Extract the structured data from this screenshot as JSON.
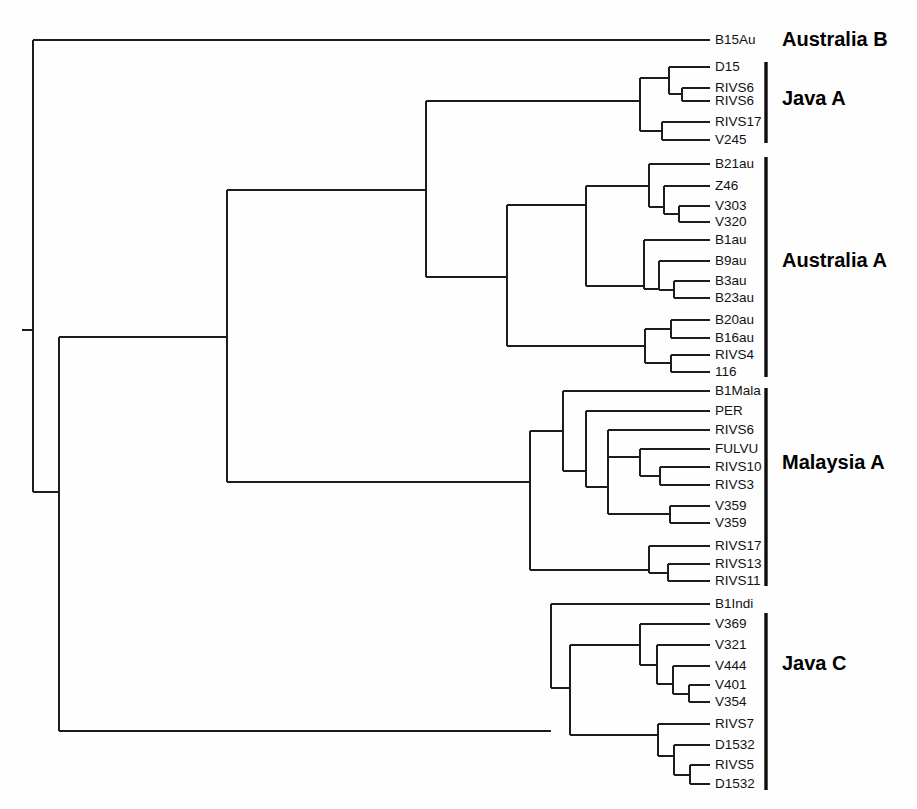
{
  "figure": {
    "name": "phylogenetic-dendrogram",
    "type": "dendrogram",
    "width": 917,
    "height": 809,
    "background_color": "#fefefe",
    "line_color": "#1c1c1c",
    "text_color": "#121212",
    "group_label_color": "#000000"
  },
  "leaves": [
    {
      "id": "L0",
      "label": "B15Au",
      "y": 40,
      "x_tip": 710,
      "group": "Australia B"
    },
    {
      "id": "L1",
      "label": "D15",
      "y": 67,
      "x_tip": 710,
      "group": "Java A"
    },
    {
      "id": "L2",
      "label": "RIVS6",
      "y": 88,
      "x_tip": 710,
      "group": "Java A"
    },
    {
      "id": "L3",
      "label": "RIVS6",
      "y": 101,
      "x_tip": 710,
      "group": "Java A"
    },
    {
      "id": "L4",
      "label": "RIVS17",
      "y": 122,
      "x_tip": 710,
      "group": "Java A"
    },
    {
      "id": "L5",
      "label": "V245",
      "y": 140,
      "x_tip": 710,
      "group": "Java A"
    },
    {
      "id": "L6",
      "label": "B21au",
      "y": 164,
      "x_tip": 710,
      "group": "Australia A"
    },
    {
      "id": "L7",
      "label": "Z46",
      "y": 186,
      "x_tip": 710,
      "group": "Australia A"
    },
    {
      "id": "L8",
      "label": "V303",
      "y": 206,
      "x_tip": 710,
      "group": "Australia A"
    },
    {
      "id": "L9",
      "label": "V320",
      "y": 222,
      "x_tip": 710,
      "group": "Australia A"
    },
    {
      "id": "L10",
      "label": "B1au",
      "y": 240,
      "x_tip": 710,
      "group": "Australia A"
    },
    {
      "id": "L11",
      "label": "B9au",
      "y": 261,
      "x_tip": 710,
      "group": "Australia A"
    },
    {
      "id": "L12",
      "label": "B3au",
      "y": 281,
      "x_tip": 710,
      "group": "Australia A"
    },
    {
      "id": "L13",
      "label": "B23au",
      "y": 298,
      "x_tip": 710,
      "group": "Australia A"
    },
    {
      "id": "L14",
      "label": "B20au",
      "y": 320,
      "x_tip": 710,
      "group": "Australia A"
    },
    {
      "id": "L15",
      "label": "B16au",
      "y": 338,
      "x_tip": 710,
      "group": "Australia A"
    },
    {
      "id": "L16",
      "label": "RIVS4",
      "y": 355,
      "x_tip": 710,
      "group": "Australia A"
    },
    {
      "id": "L17",
      "label": "116",
      "y": 372,
      "x_tip": 710,
      "group": "Australia A"
    },
    {
      "id": "L18",
      "label": "B1Mala",
      "y": 391,
      "x_tip": 710,
      "group": "Malaysia A"
    },
    {
      "id": "L19",
      "label": "PER",
      "y": 411,
      "x_tip": 710,
      "group": "Malaysia A"
    },
    {
      "id": "L20",
      "label": "RIVS6",
      "y": 430,
      "x_tip": 710,
      "group": "Malaysia A"
    },
    {
      "id": "L21",
      "label": "FULVU",
      "y": 449,
      "x_tip": 710,
      "group": "Malaysia A"
    },
    {
      "id": "L22",
      "label": "RIVS10",
      "y": 467,
      "x_tip": 710,
      "group": "Malaysia A"
    },
    {
      "id": "L23",
      "label": "RIVS3",
      "y": 485,
      "x_tip": 710,
      "group": "Malaysia A"
    },
    {
      "id": "L24",
      "label": "V359",
      "y": 506,
      "x_tip": 710,
      "group": "Malaysia A"
    },
    {
      "id": "L25",
      "label": "V359",
      "y": 523,
      "x_tip": 710,
      "group": "Malaysia A"
    },
    {
      "id": "L26",
      "label": "RIVS17",
      "y": 546,
      "x_tip": 710,
      "group": "Malaysia A"
    },
    {
      "id": "L27",
      "label": "RIVS13",
      "y": 564,
      "x_tip": 710,
      "group": "Malaysia A"
    },
    {
      "id": "L28",
      "label": "RIVS11",
      "y": 581,
      "x_tip": 710,
      "group": "Malaysia A"
    },
    {
      "id": "L29",
      "label": "B1Indi",
      "y": 604,
      "x_tip": 710,
      "group": "Java C"
    },
    {
      "id": "L30",
      "label": "V369",
      "y": 624,
      "x_tip": 710,
      "group": "Java C"
    },
    {
      "id": "L31",
      "label": "V321",
      "y": 645,
      "x_tip": 710,
      "group": "Java C"
    },
    {
      "id": "L32",
      "label": "V444",
      "y": 666,
      "x_tip": 710,
      "group": "Java C"
    },
    {
      "id": "L33",
      "label": "V401",
      "y": 685,
      "x_tip": 710,
      "group": "Java C"
    },
    {
      "id": "L34",
      "label": "V354",
      "y": 702,
      "x_tip": 710,
      "group": "Java C"
    },
    {
      "id": "L35",
      "label": "RIVS7",
      "y": 724,
      "x_tip": 710,
      "group": "Java C"
    },
    {
      "id": "L36",
      "label": "D1532",
      "y": 745,
      "x_tip": 710,
      "group": "Java C"
    },
    {
      "id": "L37",
      "label": "RIVS5",
      "y": 765,
      "x_tip": 710,
      "group": "Java C"
    },
    {
      "id": "L38",
      "label": "D1532",
      "y": 784,
      "x_tip": 710,
      "group": "Java C"
    }
  ],
  "internal_nodes": [
    {
      "id": "N_root",
      "x": 33,
      "y_top": 40,
      "y_bottom": 492,
      "x_parent": 22,
      "y": 330
    },
    {
      "id": "N_main",
      "x": 59,
      "y_top": 337,
      "y_bottom": 731,
      "x_parent": 33,
      "y": 492
    },
    {
      "id": "N_aus_java",
      "x": 227,
      "y_top": 190,
      "y_bottom": 482,
      "x_parent": 59,
      "y": 337
    },
    {
      "id": "N_javaA_ausA",
      "x": 426,
      "y_top": 101,
      "y_bottom": 277,
      "x_parent": 227,
      "y": 190
    },
    {
      "id": "N_javaA",
      "x": 640,
      "y_top": 78,
      "y_bottom": 131,
      "x_parent": 426,
      "y": 101
    },
    {
      "id": "N_javaA_a",
      "x": 669,
      "y_top": 67,
      "y_bottom": 94,
      "x_parent": 640,
      "y": 78
    },
    {
      "id": "N_javaA_b",
      "x": 682,
      "y_top": 88,
      "y_bottom": 101,
      "x_parent": 669,
      "y": 94
    },
    {
      "id": "N_javaA_c",
      "x": 662,
      "y_top": 122,
      "y_bottom": 140,
      "x_parent": 640,
      "y": 131
    },
    {
      "id": "N_ausA",
      "x": 507,
      "y_top": 205,
      "y_bottom": 346,
      "x_parent": 426,
      "y": 277
    },
    {
      "id": "N_ausA_up",
      "x": 586,
      "y_top": 186,
      "y_bottom": 286,
      "x_parent": 507,
      "y": 205
    },
    {
      "id": "N_ausA_a",
      "x": 649,
      "y_top": 164,
      "y_bottom": 207,
      "x_parent": 586,
      "y": 186
    },
    {
      "id": "N_ausA_b",
      "x": 664,
      "y_top": 186,
      "y_bottom": 214,
      "x_parent": 649,
      "y": 207
    },
    {
      "id": "N_ausA_c",
      "x": 679,
      "y_top": 206,
      "y_bottom": 222,
      "x_parent": 664,
      "y": 214
    },
    {
      "id": "N_ausA_d",
      "x": 644,
      "y_top": 240,
      "y_bottom": 289,
      "x_parent": 586,
      "y": 286
    },
    {
      "id": "N_ausA_e",
      "x": 659,
      "y_top": 261,
      "y_bottom": 290,
      "x_parent": 644,
      "y": 289
    },
    {
      "id": "N_ausA_f",
      "x": 674,
      "y_top": 281,
      "y_bottom": 298,
      "x_parent": 659,
      "y": 290
    },
    {
      "id": "N_ausA_g",
      "x": 645,
      "y_top": 329,
      "y_bottom": 363,
      "x_parent": 507,
      "y": 346
    },
    {
      "id": "N_ausA_h",
      "x": 671,
      "y_top": 320,
      "y_bottom": 338,
      "x_parent": 645,
      "y": 329
    },
    {
      "id": "N_ausA_i",
      "x": 671,
      "y_top": 355,
      "y_bottom": 372,
      "x_parent": 645,
      "y": 363
    },
    {
      "id": "N_mal",
      "x": 530,
      "y_top": 431,
      "y_bottom": 570,
      "x_parent": 227,
      "y": 482
    },
    {
      "id": "N_mal_up",
      "x": 563,
      "y_top": 391,
      "y_bottom": 471,
      "x_parent": 530,
      "y": 431
    },
    {
      "id": "N_mal_a",
      "x": 586,
      "y_top": 411,
      "y_bottom": 487,
      "x_parent": 563,
      "y": 471
    },
    {
      "id": "N_mal_b",
      "x": 608,
      "y_top": 430,
      "y_bottom": 514,
      "x_parent": 586,
      "y": 487
    },
    {
      "id": "N_mal_c",
      "x": 640,
      "y_top": 449,
      "y_bottom": 476,
      "x_parent": 608,
      "y": 457
    },
    {
      "id": "N_mal_d",
      "x": 660,
      "y_top": 467,
      "y_bottom": 485,
      "x_parent": 640,
      "y": 476
    },
    {
      "id": "N_mal_e",
      "x": 670,
      "y_top": 506,
      "y_bottom": 523,
      "x_parent": 608,
      "y": 514
    },
    {
      "id": "N_mal_f",
      "x": 649,
      "y_top": 546,
      "y_bottom": 573,
      "x_parent": 530,
      "y": 570
    },
    {
      "id": "N_mal_g",
      "x": 668,
      "y_top": 564,
      "y_bottom": 581,
      "x_parent": 649,
      "y": 573
    },
    {
      "id": "N_javaC",
      "x": 551,
      "y_top": 604,
      "y_bottom": 688,
      "x_parent": 59,
      "y": 731
    },
    {
      "id": "N_javaC_in",
      "x": 570,
      "y_top": 645,
      "y_bottom": 735,
      "x_parent": 551,
      "y": 688
    },
    {
      "id": "N_javaC_a",
      "x": 640,
      "y_top": 624,
      "y_bottom": 665,
      "x_parent": 570,
      "y": 645
    },
    {
      "id": "N_javaC_b",
      "x": 657,
      "y_top": 645,
      "y_bottom": 684,
      "x_parent": 640,
      "y": 665
    },
    {
      "id": "N_javaC_c",
      "x": 673,
      "y_top": 666,
      "y_bottom": 694,
      "x_parent": 657,
      "y": 684
    },
    {
      "id": "N_javaC_d",
      "x": 689,
      "y_top": 685,
      "y_bottom": 702,
      "x_parent": 673,
      "y": 694
    },
    {
      "id": "N_javaC_e",
      "x": 658,
      "y_top": 724,
      "y_bottom": 756,
      "x_parent": 570,
      "y": 735
    },
    {
      "id": "N_javaC_f",
      "x": 674,
      "y_top": 745,
      "y_bottom": 775,
      "x_parent": 658,
      "y": 756
    },
    {
      "id": "N_javaC_g",
      "x": 690,
      "y_top": 765,
      "y_bottom": 784,
      "x_parent": 674,
      "y": 775
    }
  ],
  "groups": [
    {
      "id": "G0",
      "label": "Australia B",
      "bracket": false,
      "bracket_x": 766,
      "y_top": 40,
      "y_bottom": 40,
      "label_x": 782,
      "label_y": 41
    },
    {
      "id": "G1",
      "label": "Java A",
      "bracket": true,
      "bracket_x": 766,
      "y_top": 62,
      "y_bottom": 143,
      "label_x": 782,
      "label_y": 100
    },
    {
      "id": "G2",
      "label": "Australia A",
      "bracket": true,
      "bracket_x": 766,
      "y_top": 157,
      "y_bottom": 377,
      "label_x": 782,
      "label_y": 262
    },
    {
      "id": "G3",
      "label": "Malaysia A",
      "bracket": true,
      "bracket_x": 766,
      "y_top": 388,
      "y_bottom": 586,
      "label_x": 782,
      "label_y": 464
    },
    {
      "id": "G4",
      "label": "Java C",
      "bracket": true,
      "bracket_x": 766,
      "y_top": 613,
      "y_bottom": 790,
      "label_x": 782,
      "label_y": 665
    }
  ],
  "chart_data": {
    "type": "dendrogram",
    "title": "",
    "orientation": "horizontal-right",
    "n_leaves": 39,
    "clusters": [
      {
        "name": "Australia B",
        "members": [
          "B15Au"
        ]
      },
      {
        "name": "Java A",
        "members": [
          "D15",
          "RIVS6",
          "RIVS6",
          "RIVS17",
          "V245"
        ]
      },
      {
        "name": "Australia A",
        "members": [
          "B21au",
          "Z46",
          "V303",
          "V320",
          "B1au",
          "B9au",
          "B3au",
          "B23au",
          "B20au",
          "B16au",
          "RIVS4",
          "116"
        ]
      },
      {
        "name": "Malaysia A",
        "members": [
          "B1Mala",
          "PER",
          "RIVS6",
          "FULVU",
          "RIVS10",
          "RIVS3",
          "V359",
          "V359",
          "RIVS17",
          "RIVS13",
          "RIVS11"
        ]
      },
      {
        "name": "Java C",
        "members": [
          "B1Indi",
          "V369",
          "V321",
          "V444",
          "V401",
          "V354",
          "RIVS7",
          "D1532",
          "RIVS5",
          "D1532"
        ]
      }
    ],
    "topology_newick": "(B15Au,(((D15,(RIVS6,RIVS6)),(RIVS17,V245)),(((B21au,(Z46,(V303,V320))),(B1au,(B9au,(B3au,B23au)))),((B20au,B16au),(RIVS4,116)))),(((B1Mala,(PER,(RIVS6,((FULVU,(RIVS10,RIVS3)),(V359,V359))))),(RIVS17,(RIVS13,RIVS11))),((B1Indi,((V369,(V321,(V444,(V401,V354)))),(RIVS7,(D1532,(RIVS5,D1532)))))))"
  }
}
